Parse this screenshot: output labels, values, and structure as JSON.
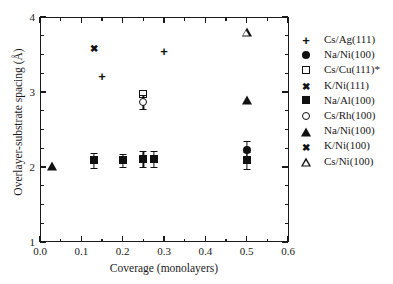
{
  "chart_data": {
    "type": "scatter",
    "title": "",
    "xlabel": "Coverage (monolayers)",
    "ylabel": "Overlayer-substrate spacing (Å)",
    "xlim": [
      0.0,
      0.6
    ],
    "ylim": [
      1,
      4
    ],
    "xticks": [
      "0.0",
      "0.1",
      "0.2",
      "0.3",
      "0.4",
      "0.5",
      "0.6"
    ],
    "xtick_values": [
      0.0,
      0.1,
      0.2,
      0.3,
      0.4,
      0.5,
      0.6
    ],
    "xminor_step": 0.05,
    "yticks": [
      "1",
      "2",
      "3",
      "4"
    ],
    "ytick_values": [
      1,
      2,
      3,
      4
    ],
    "yminor_step": 0.25,
    "grid": false,
    "legend_position": "right",
    "series": [
      {
        "name": "Cs/Ag(111)",
        "marker": "plus",
        "points": [
          {
            "x": 0.15,
            "y": 3.22
          },
          {
            "x": 0.3,
            "y": 3.55
          }
        ]
      },
      {
        "name": "Na/Ni(100)",
        "marker": "circle-filled",
        "points": [
          {
            "x": 0.5,
            "y": 2.23,
            "yerr": 0.12
          }
        ]
      },
      {
        "name": "Cs/Cu(111)*",
        "marker": "square-open",
        "points": [
          {
            "x": 0.25,
            "y": 2.98
          }
        ]
      },
      {
        "name": "K/Ni(111)",
        "marker": "asterisk",
        "points": [
          {
            "x": 0.13,
            "y": 3.57
          }
        ]
      },
      {
        "name": "Na/Al(100)",
        "marker": "square-filled",
        "points": [
          {
            "x": 0.13,
            "y": 2.09,
            "yerr": 0.1
          },
          {
            "x": 0.2,
            "y": 2.09,
            "yerr": 0.09
          },
          {
            "x": 0.25,
            "y": 2.11,
            "yerr": 0.11
          },
          {
            "x": 0.275,
            "y": 2.11,
            "yerr": 0.11
          },
          {
            "x": 0.5,
            "y": 2.09,
            "yerr": 0.11
          }
        ]
      },
      {
        "name": "Cs/Rh(100)",
        "marker": "circle-open",
        "points": [
          {
            "x": 0.25,
            "y": 2.87,
            "yerr": 0.09
          }
        ]
      },
      {
        "name": "Na/Ni(100)",
        "marker": "triangle-filled",
        "points": [
          {
            "x": 0.03,
            "y": 2.01
          },
          {
            "x": 0.5,
            "y": 2.9
          }
        ]
      },
      {
        "name": "K/Ni(100)",
        "marker": "xstar",
        "points": []
      },
      {
        "name": "Cs/Ni(100)",
        "marker": "triangle-open",
        "points": [
          {
            "x": 0.5,
            "y": 3.8
          }
        ]
      }
    ],
    "legend": [
      {
        "marker": "plus",
        "label": "Cs/Ag(111)"
      },
      {
        "marker": "circle-filled",
        "label": "Na/Ni(100)"
      },
      {
        "marker": "square-open",
        "label": "Cs/Cu(111)*"
      },
      {
        "marker": "asterisk",
        "label": "K/Ni(111)"
      },
      {
        "marker": "square-filled",
        "label": "Na/Al(100)"
      },
      {
        "marker": "circle-open",
        "label": "Cs/Rh(100)"
      },
      {
        "marker": "triangle-filled",
        "label": "Na/Ni(100)"
      },
      {
        "marker": "xstar",
        "label": "K/Ni(100)"
      },
      {
        "marker": "triangle-open",
        "label": "Cs/Ni(100)"
      }
    ],
    "colors": {
      "axis": "#1a1a1a",
      "marker": "#111111",
      "background": "#ffffff"
    }
  }
}
